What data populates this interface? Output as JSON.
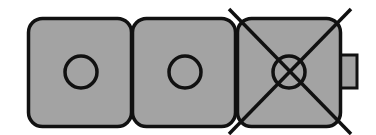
{
  "diagram": {
    "colors": {
      "background": "#ffffff",
      "module_fill": "#a3a3a3",
      "stroke": "#111111"
    },
    "modules": [
      {
        "index": 1,
        "state": "normal",
        "symbol": "circle-icon"
      },
      {
        "index": 2,
        "state": "normal",
        "symbol": "circle-icon"
      },
      {
        "index": 3,
        "state": "crossed-out",
        "symbol": "circle-x-icon",
        "has_side_tab": true
      }
    ]
  }
}
